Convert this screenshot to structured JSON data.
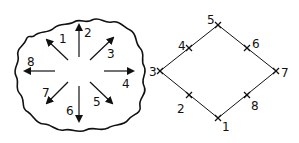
{
  "figure": {
    "blob": {
      "arrows": [
        {
          "label": "1",
          "direction": "up-left"
        },
        {
          "label": "2",
          "direction": "up"
        },
        {
          "label": "3",
          "direction": "up-right"
        },
        {
          "label": "4",
          "direction": "right"
        },
        {
          "label": "5",
          "direction": "down-right"
        },
        {
          "label": "6",
          "direction": "down"
        },
        {
          "label": "7",
          "direction": "down-left"
        },
        {
          "label": "8",
          "direction": "left"
        }
      ]
    },
    "diamond": {
      "points": [
        {
          "label": "1",
          "position": "bottom vertex"
        },
        {
          "label": "2",
          "position": "lower-left edge midpoint"
        },
        {
          "label": "3",
          "position": "left vertex"
        },
        {
          "label": "4",
          "position": "upper-left edge midpoint"
        },
        {
          "label": "5",
          "position": "top vertex"
        },
        {
          "label": "6",
          "position": "upper-right edge midpoint"
        },
        {
          "label": "7",
          "position": "right vertex"
        },
        {
          "label": "8",
          "position": "lower-right edge midpoint"
        }
      ]
    },
    "colors": {
      "stroke": "#111111",
      "background": "#ffffff"
    }
  }
}
